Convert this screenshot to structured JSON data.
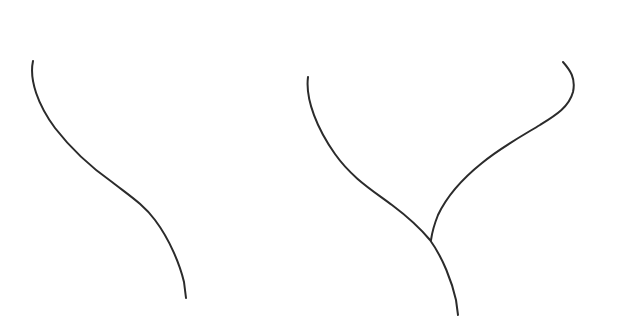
{
  "figure": {
    "width": 619,
    "height": 329,
    "background": "#ffffff",
    "stroke_color": "#2b2b2b",
    "panels": [
      {
        "name": "single-curve",
        "description": "single S-shaped line curving down from upper left to lower right"
      },
      {
        "name": "branching-curve",
        "description": "two lines merging at a junction into a single stem, forming a Y shape"
      }
    ]
  }
}
